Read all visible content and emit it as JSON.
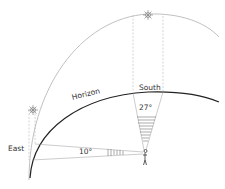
{
  "diagram": {
    "labels": {
      "horizon": "Horizon",
      "south": "South",
      "east": "East",
      "angle_east": "10°",
      "angle_south": "27°"
    },
    "elements": {
      "sky_arc": "sun path arc",
      "horizon_arc": "horizon line",
      "sun_high": "sun at south",
      "sun_low": "sun at east",
      "observer": "person observer"
    },
    "colors": {
      "line": "#222222",
      "light_line": "#aaaaaa",
      "text": "#333333"
    }
  }
}
